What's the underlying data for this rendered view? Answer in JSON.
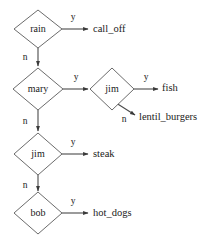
{
  "diagram": {
    "type": "decision-tree",
    "title": "",
    "background_color": "#ffffff",
    "line_color": "#4a4a4a",
    "shape_fill": "#ffffff",
    "shape_stroke": "#5a5a5a",
    "text_color": "#1a1a1a",
    "decision_nodes": [
      {
        "id": "rain",
        "label": "rain",
        "cx": 38,
        "cy": 29,
        "rx": 24,
        "ry": 19
      },
      {
        "id": "mary",
        "label": "mary",
        "cx": 38,
        "cy": 89,
        "rx": 25,
        "ry": 21
      },
      {
        "id": "jim2",
        "label": "jim",
        "cx": 112,
        "cy": 89,
        "rx": 22,
        "ry": 21
      },
      {
        "id": "jim1",
        "label": "jim",
        "cx": 38,
        "cy": 154,
        "rx": 24,
        "ry": 21
      },
      {
        "id": "bob",
        "label": "bob",
        "cx": 38,
        "cy": 213,
        "rx": 24,
        "ry": 21
      }
    ],
    "leaf_nodes": [
      {
        "id": "call_off",
        "label": "call_off",
        "x": 93,
        "y": 29
      },
      {
        "id": "fish",
        "label": "fish",
        "x": 162,
        "y": 88
      },
      {
        "id": "lentil_burgers",
        "label": "lentil_burgers",
        "x": 139,
        "y": 117
      },
      {
        "id": "steak",
        "label": "steak",
        "x": 93,
        "y": 154
      },
      {
        "id": "hot_dogs",
        "label": "hot_dogs",
        "x": 93,
        "y": 213
      }
    ],
    "edges": [
      {
        "id": "rain-yes",
        "from": "rain",
        "to": "call_off",
        "label": "y",
        "label_x": 73,
        "label_y": 18,
        "direction": "right"
      },
      {
        "id": "rain-no",
        "from": "rain",
        "to": "mary",
        "label": "n",
        "label_x": 25,
        "label_y": 58,
        "direction": "down"
      },
      {
        "id": "mary-yes",
        "from": "mary",
        "to": "jim2",
        "label": "y",
        "label_x": 76,
        "label_y": 78,
        "direction": "right"
      },
      {
        "id": "mary-no",
        "from": "mary",
        "to": "jim1",
        "label": "n",
        "label_x": 25,
        "label_y": 122,
        "direction": "down"
      },
      {
        "id": "jim2-yes",
        "from": "jim2",
        "to": "fish",
        "label": "y",
        "label_x": 146,
        "label_y": 78,
        "direction": "right"
      },
      {
        "id": "jim2-no",
        "from": "jim2",
        "to": "lentil_burgers",
        "label": "n",
        "label_x": 124,
        "label_y": 120,
        "direction": "diagonal-down-right"
      },
      {
        "id": "jim1-yes",
        "from": "jim1",
        "to": "steak",
        "label": "y",
        "label_x": 73,
        "label_y": 143,
        "direction": "right"
      },
      {
        "id": "jim1-no",
        "from": "jim1",
        "to": "bob",
        "label": "n",
        "label_x": 25,
        "label_y": 186,
        "direction": "down"
      },
      {
        "id": "bob-yes",
        "from": "bob",
        "to": "hot_dogs",
        "label": "y",
        "label_x": 73,
        "label_y": 202,
        "direction": "right"
      }
    ]
  }
}
